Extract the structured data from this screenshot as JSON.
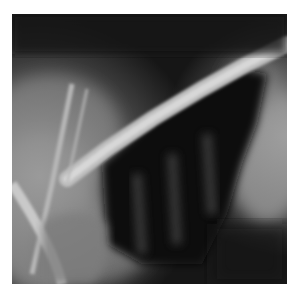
{
  "image": {
    "subject": "lateral thoracic radiograph",
    "frame": {
      "x": 12,
      "y": 14,
      "width": 275,
      "height": 270
    },
    "colors": {
      "background": "#ffffff",
      "dark_field": "#141414",
      "bone": "#cfcfcf",
      "soft_tissue": "#7a7a7a"
    }
  }
}
